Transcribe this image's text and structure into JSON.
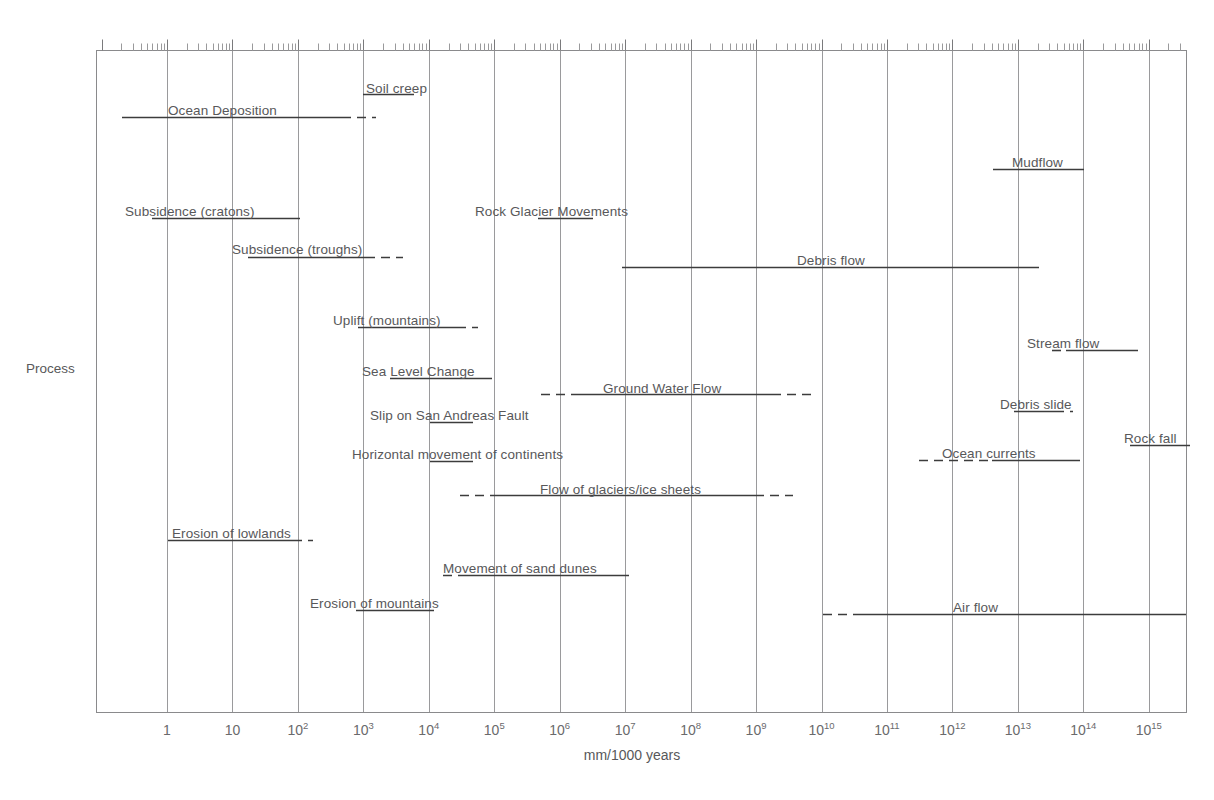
{
  "chart_data": {
    "type": "bar",
    "orientation": "horizontal-ranges",
    "title": "",
    "xlabel": "mm/1000 years",
    "ylabel": "Process",
    "xscale": "log",
    "xlim": [
      0.03,
      5000000000000000.0
    ],
    "grid": true,
    "legend": "none",
    "xticks": [
      {
        "label": "1",
        "exp": "",
        "value": 1
      },
      {
        "label": "10",
        "exp": "",
        "value": 10
      },
      {
        "label": "10",
        "exp": "2",
        "value": 100
      },
      {
        "label": "10",
        "exp": "3",
        "value": 1000
      },
      {
        "label": "10",
        "exp": "4",
        "value": 10000
      },
      {
        "label": "10",
        "exp": "5",
        "value": 100000
      },
      {
        "label": "10",
        "exp": "6",
        "value": 1000000
      },
      {
        "label": "10",
        "exp": "7",
        "value": 10000000
      },
      {
        "label": "10",
        "exp": "8",
        "value": 100000000
      },
      {
        "label": "10",
        "exp": "9",
        "value": 1000000000
      },
      {
        "label": "10",
        "exp": "10",
        "value": 10000000000.0
      },
      {
        "label": "10",
        "exp": "11",
        "value": 100000000000.0
      },
      {
        "label": "10",
        "exp": "12",
        "value": 1000000000000.0
      },
      {
        "label": "10",
        "exp": "13",
        "value": 10000000000000.0
      },
      {
        "label": "10",
        "exp": "14",
        "value": 100000000000000.0
      },
      {
        "label": "10",
        "exp": "15",
        "value": 1000000000000000.0
      }
    ],
    "bars": [
      {
        "name": "Soil creep",
        "label_x": 366,
        "label_y": 82,
        "label_anchor": "start",
        "solid": [
          363,
          414
        ],
        "dash_left": null,
        "dash_right": null,
        "y": 94
      },
      {
        "name": "Ocean Deposition",
        "label_x": 168,
        "label_y": 104,
        "label_anchor": "start",
        "solid": [
          122,
          342
        ],
        "dash_left": null,
        "dash_right": [
          342,
          376
        ],
        "y": 117
      },
      {
        "name": "Mudflow",
        "label_x": 1012,
        "label_y": 156,
        "label_anchor": "start",
        "solid": [
          993,
          1084
        ],
        "dash_left": null,
        "dash_right": null,
        "y": 169
      },
      {
        "name": "Subsidence (cratons)",
        "label_x": 125,
        "label_y": 205,
        "label_anchor": "start",
        "solid": [
          152,
          300
        ],
        "dash_left": null,
        "dash_right": null,
        "y": 218
      },
      {
        "name": "Rock Glacier Movements",
        "label_x": 475,
        "label_y": 205,
        "label_anchor": "start",
        "solid": [
          538,
          593
        ],
        "dash_left": null,
        "dash_right": null,
        "y": 218
      },
      {
        "name": "Subsidence (troughs)",
        "label_x": 232,
        "label_y": 243,
        "label_anchor": "start",
        "solid": [
          248,
          366
        ],
        "dash_left": null,
        "dash_right": [
          366,
          403
        ],
        "y": 257
      },
      {
        "name": "Debris flow",
        "label_x": 797,
        "label_y": 254,
        "label_anchor": "start",
        "solid": [
          622,
          1039
        ],
        "dash_left": null,
        "dash_right": null,
        "y": 267
      },
      {
        "name": "Uplift (mountains)",
        "label_x": 333,
        "label_y": 314,
        "label_anchor": "start",
        "solid": [
          358,
          457
        ],
        "dash_left": null,
        "dash_right": [
          457,
          478
        ],
        "y": 327
      },
      {
        "name": "Stream flow",
        "label_x": 1027,
        "label_y": 337,
        "label_anchor": "start",
        "solid": [
          1066,
          1138
        ],
        "dash_left": [
          1052,
          1066
        ],
        "dash_right": null,
        "y": 350
      },
      {
        "name": "Sea Level Change",
        "label_x": 362,
        "label_y": 365,
        "label_anchor": "start",
        "solid": [
          390,
          492
        ],
        "dash_left": null,
        "dash_right": null,
        "y": 378
      },
      {
        "name": "Ground Water Flow",
        "label_x": 603,
        "label_y": 382,
        "label_anchor": "start",
        "solid": [
          574,
          772
        ],
        "dash_left": [
          541,
          574
        ],
        "dash_right": [
          772,
          811
        ],
        "y": 394
      },
      {
        "name": "Debris slide",
        "label_x": 1000,
        "label_y": 398,
        "label_anchor": "start",
        "solid": [
          1014,
          1055
        ],
        "dash_left": null,
        "dash_right": [
          1055,
          1073
        ],
        "y": 411
      },
      {
        "name": "Slip on San Andreas Fault",
        "label_x": 370,
        "label_y": 409,
        "label_anchor": "start",
        "solid": [
          430,
          473
        ],
        "dash_left": null,
        "dash_right": null,
        "y": 422
      },
      {
        "name": "Rock fall",
        "label_x": 1124,
        "label_y": 432,
        "label_anchor": "start",
        "solid": [
          1130,
          1190
        ],
        "dash_left": null,
        "dash_right": null,
        "y": 445
      },
      {
        "name": "Horizontal movement of continents",
        "label_x": 352,
        "label_y": 448,
        "label_anchor": "start",
        "solid": [
          430,
          473
        ],
        "dash_left": null,
        "dash_right": null,
        "y": 461
      },
      {
        "name": "Ocean currents",
        "label_x": 942,
        "label_y": 447,
        "label_anchor": "start",
        "solid": [
          992,
          1080
        ],
        "dash_left": [
          919,
          992
        ],
        "dash_right": null,
        "y": 460
      },
      {
        "name": "Flow of glaciers/ice sheets",
        "label_x": 540,
        "label_y": 483,
        "label_anchor": "start",
        "solid": [
          495,
          755
        ],
        "dash_left": [
          460,
          495
        ],
        "dash_right": [
          755,
          793
        ],
        "y": 495
      },
      {
        "name": "Erosion of lowlands",
        "label_x": 172,
        "label_y": 527,
        "label_anchor": "start",
        "solid": [
          168,
          293
        ],
        "dash_left": null,
        "dash_right": [
          293,
          313
        ],
        "y": 540
      },
      {
        "name": "Movement of sand dunes",
        "label_x": 443,
        "label_y": 562,
        "label_anchor": "start",
        "solid": [
          463,
          629
        ],
        "dash_left": [
          443,
          463
        ],
        "dash_right": null,
        "y": 575
      },
      {
        "name": "Erosion of mountains",
        "label_x": 310,
        "label_y": 597,
        "label_anchor": "start",
        "solid": [
          356,
          434
        ],
        "dash_left": null,
        "dash_right": null,
        "y": 610
      },
      {
        "name": "Air flow",
        "label_x": 953,
        "label_y": 601,
        "label_anchor": "start",
        "solid": [
          858,
          1186
        ],
        "dash_left": [
          823,
          858
        ],
        "dash_right": null,
        "y": 614
      }
    ]
  },
  "axes": {
    "x_title": "mm/1000 years",
    "y_title": "Process"
  },
  "colors": {
    "bar": "#3c3c3c",
    "grid": "#9a9a9c",
    "frame": "#8a8a8c",
    "text": "#58585a"
  }
}
